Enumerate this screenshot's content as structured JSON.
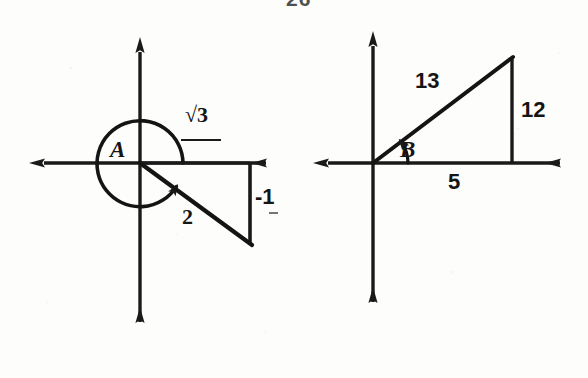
{
  "page": {
    "number": "26",
    "background_color": "#fdfdfb",
    "ink_color": "#1a1a1a",
    "width": 588,
    "height": 378
  },
  "figures": [
    {
      "id": "figure-left",
      "angle_label": "A",
      "description": "Angle A in standard position, terminal side in quadrant IV, swept counterclockwise more than 180 degrees",
      "origin": {
        "x": 140,
        "y": 163
      },
      "axes": {
        "x_axis": {
          "x1": 28,
          "y1": 163,
          "x2": 272,
          "y2": 163,
          "arrows": "both"
        },
        "y_axis": {
          "x1": 140,
          "y1": 38,
          "x2": 140,
          "y2": 330,
          "arrows": "both"
        }
      },
      "arc": {
        "type": "angle-sweep-arc",
        "radius": 43,
        "start_deg": 0,
        "end_deg": 330,
        "direction": "counterclockwise",
        "arrowhead_at": "end"
      },
      "terminal_point": {
        "x": 250,
        "y": 243
      },
      "triangle": {
        "vertices": [
          [
            140,
            163
          ],
          [
            250,
            163
          ],
          [
            250,
            243
          ]
        ],
        "hypotenuse_label": "2",
        "vertical_leg_label": "-1",
        "horizontal_leg_label": "√3"
      },
      "labels": [
        {
          "name": "angle-label-a",
          "text": "A"
        },
        {
          "name": "side-label-root3",
          "text": "√3"
        },
        {
          "name": "side-label-negative-one",
          "text": "-1"
        },
        {
          "name": "side-label-two",
          "text": "2"
        }
      ]
    },
    {
      "id": "figure-right",
      "angle_label": "B",
      "description": "Angle B in standard position, terminal side in quadrant I, 5-12-13 right triangle",
      "origin": {
        "x": 373,
        "y": 163
      },
      "axes": {
        "x_axis": {
          "x1": 312,
          "y1": 163,
          "x2": 566,
          "y2": 163,
          "arrows": "both"
        },
        "y_axis": {
          "x1": 373,
          "y1": 32,
          "x2": 373,
          "y2": 310,
          "arrows": "both"
        }
      },
      "arc": {
        "type": "angle-sweep-arc",
        "radius": 35,
        "start_deg": 0,
        "end_deg": 67,
        "direction": "counterclockwise",
        "arrowhead_at": "end"
      },
      "terminal_point": {
        "x": 512,
        "y": 57
      },
      "triangle": {
        "vertices": [
          [
            373,
            163
          ],
          [
            512,
            163
          ],
          [
            512,
            57
          ]
        ],
        "hypotenuse_label": "13",
        "vertical_leg_label": "12",
        "horizontal_leg_label": "5"
      },
      "labels": [
        {
          "name": "angle-label-b",
          "text": "B"
        },
        {
          "name": "side-label-thirteen",
          "text": "13"
        },
        {
          "name": "side-label-twelve",
          "text": "12"
        },
        {
          "name": "side-label-five",
          "text": "5"
        }
      ]
    }
  ]
}
